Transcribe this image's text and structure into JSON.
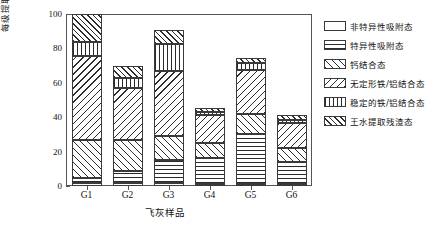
{
  "chart_data": {
    "type": "bar",
    "subtype": "stacked-bar",
    "title": "",
    "xlabel": "飞灰样品",
    "ylabel": "每级提取砷含量/总砷含量/%",
    "categories": [
      "G1",
      "G2",
      "G3",
      "G4",
      "G5",
      "G6"
    ],
    "ylim": [
      0,
      100
    ],
    "yticks": [
      0,
      20,
      40,
      60,
      80,
      100
    ],
    "ytick_labels": [
      "0",
      "20",
      "40",
      "60",
      "80",
      "100"
    ],
    "grid": false,
    "legend_position": "right",
    "series": [
      {
        "name": "非特异性吸附态",
        "pattern": "blank",
        "values": [
          2.0,
          2.0,
          2.0,
          1.0,
          1.0,
          1.0
        ]
      },
      {
        "name": "特异性吸附态",
        "pattern": "horizontal-lines",
        "values": [
          2.5,
          7.0,
          13.0,
          15.0,
          29.0,
          13.0
        ]
      },
      {
        "name": "钙结合态",
        "pattern": "backslash-hatch",
        "values": [
          22.5,
          18.0,
          14.0,
          9.0,
          12.0,
          8.0
        ]
      },
      {
        "name": "无定形铁/铝结合态",
        "pattern": "forwardslash-hatch",
        "values": [
          48.5,
          30.0,
          38.0,
          16.0,
          25.5,
          14.5
        ]
      },
      {
        "name": "稳定的铁/铝结合态",
        "pattern": "vertical-lines",
        "values": [
          8.5,
          6.0,
          15.5,
          2.0,
          4.0,
          2.0
        ]
      },
      {
        "name": "王水提取残渣态",
        "pattern": "checkerboard",
        "values": [
          16.0,
          7.0,
          8.0,
          2.5,
          3.0,
          2.5
        ]
      }
    ],
    "totals": [
      100.0,
      70.0,
      90.5,
      45.5,
      74.5,
      41.0
    ]
  },
  "axes": {
    "y_label": "每级提取砷含量/总砷含量/%",
    "x_label": "飞灰样品",
    "y_ticks": [
      "100",
      "80",
      "60",
      "40",
      "20",
      "0"
    ],
    "x_ticks": [
      "G1",
      "G2",
      "G3",
      "G4",
      "G5",
      "G6"
    ]
  },
  "legend": {
    "items": [
      {
        "label": "非特异性吸附态",
        "pattern": "blank"
      },
      {
        "label": "特异性吸附态",
        "pattern": "horizontal-lines"
      },
      {
        "label": "钙结合态",
        "pattern": "backslash-hatch"
      },
      {
        "label": "无定形铁/铝结合态",
        "pattern": "forwardslash-hatch"
      },
      {
        "label": "稳定的铁/铝结合态",
        "pattern": "vertical-lines"
      },
      {
        "label": "王水提取残渣态",
        "pattern": "checkerboard"
      }
    ]
  }
}
